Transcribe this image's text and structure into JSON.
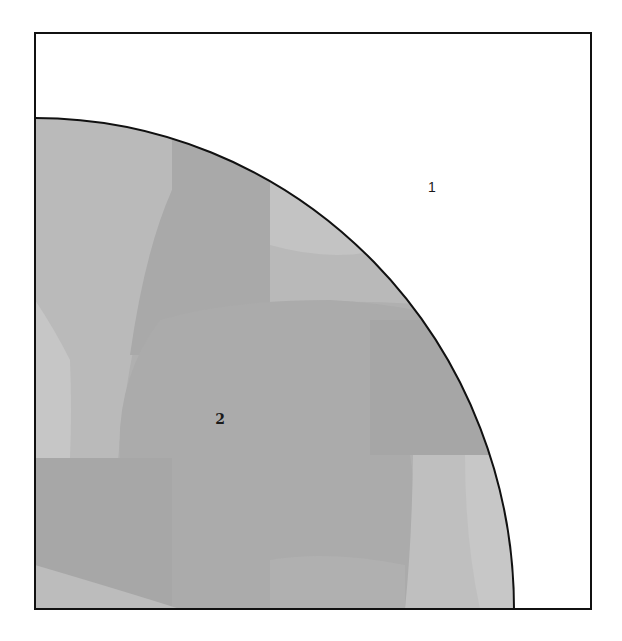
{
  "diagram": {
    "type": "square-with-quarter-circle",
    "description_visible": "Square containing a quarter circle anchored at the bottom-left corner; two labeled regions",
    "square": {
      "left": 35,
      "top": 33,
      "right": 591,
      "bottom": 609,
      "stroke": "#111111",
      "stroke_width": 2,
      "fill": "#ffffff"
    },
    "quarter_circle": {
      "center": [
        35,
        609
      ],
      "rx": 479,
      "ry": 491,
      "stroke": "#111111",
      "stroke_width": 2,
      "base_fill": "#b3b3b3"
    },
    "regions": [
      {
        "id": "region-1",
        "label": "1",
        "position": [
          432,
          187
        ],
        "fill": "#ffffff"
      },
      {
        "id": "region-2",
        "label": "2",
        "position": [
          220,
          419
        ],
        "fill": "#b3b3b3"
      }
    ],
    "shading_patches": [
      {
        "name": "patch-light-top-left",
        "color": "#bdbdbd"
      },
      {
        "name": "patch-dark-upper-column",
        "color": "#a9a9a9"
      },
      {
        "name": "patch-light-upper-right",
        "color": "#c2c2c2"
      },
      {
        "name": "patch-dark-center",
        "color": "#ababab"
      },
      {
        "name": "patch-light-left-mid",
        "color": "#c4c4c4"
      },
      {
        "name": "patch-dark-bottom-left",
        "color": "#a8a8a8"
      },
      {
        "name": "patch-light-bottom-right",
        "color": "#c0c0c0"
      },
      {
        "name": "patch-light-bottom-corner",
        "color": "#bcbcbc"
      }
    ]
  }
}
